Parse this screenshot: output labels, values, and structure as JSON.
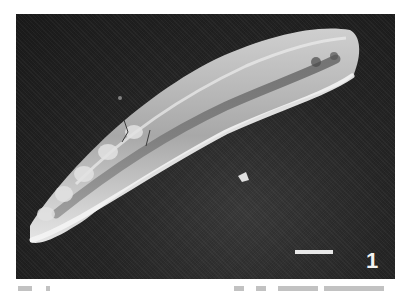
{
  "figure": {
    "panel_label": "1",
    "scale_bar": {
      "label": "",
      "color": "#e8e8e8"
    },
    "background_color": "#222222",
    "specimen_color": "#d9d9d9"
  }
}
